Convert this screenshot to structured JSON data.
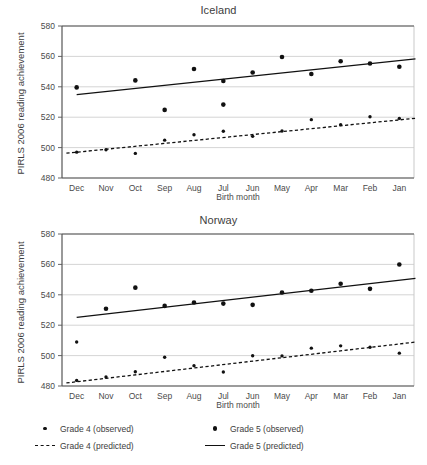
{
  "figure": {
    "background": "#ffffff",
    "ink": "#111111",
    "grid_color": "#c9c9c9",
    "axis_color": "#555555"
  },
  "legend": {
    "position": "bottom",
    "items": [
      {
        "label": "Grade 4 (observed)",
        "marker": "small-dot",
        "key": "grade4-observed"
      },
      {
        "label": "Grade 5 (observed)",
        "marker": "large-dot",
        "key": "grade5-observed"
      },
      {
        "label": "Grade 4 (predicted)",
        "marker": "dashed-line",
        "key": "grade4-predicted"
      },
      {
        "label": "Grade 5 (predicted)",
        "marker": "solid-line",
        "key": "grade5-predicted"
      }
    ]
  },
  "chart_data": [
    {
      "type": "scatter",
      "title": "Iceland",
      "xlabel": "Birth month",
      "ylabel": "PIRLS 2006 reading achievement",
      "categories": [
        "Dec",
        "Nov",
        "Oct",
        "Sep",
        "Aug",
        "Jul",
        "Jun",
        "May",
        "Apr",
        "Mar",
        "Feb",
        "Jan"
      ],
      "ylim": [
        480,
        580
      ],
      "yticks": [
        480,
        500,
        520,
        540,
        560,
        580
      ],
      "grid": true,
      "series": [
        {
          "name": "Grade 5 (observed)",
          "style": "large-dot",
          "values": [
            539.6,
            null,
            544.2,
            524.8,
            551.7,
            528.3,
            543.8,
            549.4,
            559.6,
            548.4,
            556.8,
            555.3,
            553.2
          ]
        },
        {
          "name": "Grade 4 (observed)",
          "style": "small-dot",
          "values": [
            497.0,
            498.6,
            496.2,
            504.9,
            508.5,
            510.8,
            507.4,
            510.9,
            518.4,
            515.1,
            520.3,
            519.2
          ]
        },
        {
          "name": "Grade 5 (predicted)",
          "style": "solid-line",
          "endpoints": [
            534.8,
            558.4
          ]
        },
        {
          "name": "Grade 4 (predicted)",
          "style": "dashed-line",
          "endpoints": [
            496.3,
            519.3
          ]
        }
      ],
      "observed_grade5": [
        {
          "x": "Dec",
          "y": 539.6
        },
        {
          "x": "Oct",
          "y": 544.2
        },
        {
          "x": "Sep",
          "y": 524.8
        },
        {
          "x": "Aug",
          "y": 551.7
        },
        {
          "x": "Jul",
          "y": 528.3
        },
        {
          "x": "Jul",
          "y": 543.8
        },
        {
          "x": "Jun",
          "y": 549.4
        },
        {
          "x": "May",
          "y": 559.6
        },
        {
          "x": "Apr",
          "y": 548.4
        },
        {
          "x": "Mar",
          "y": 556.8
        },
        {
          "x": "Feb",
          "y": 555.3
        },
        {
          "x": "Jan",
          "y": 553.2
        }
      ],
      "observed_grade4": [
        {
          "x": "Dec",
          "y": 497.0
        },
        {
          "x": "Nov",
          "y": 498.6
        },
        {
          "x": "Oct",
          "y": 496.2
        },
        {
          "x": "Sep",
          "y": 504.9
        },
        {
          "x": "Aug",
          "y": 508.5
        },
        {
          "x": "Jul",
          "y": 510.8
        },
        {
          "x": "Jun",
          "y": 507.4
        },
        {
          "x": "May",
          "y": 510.9
        },
        {
          "x": "Apr",
          "y": 518.4
        },
        {
          "x": "Mar",
          "y": 515.1
        },
        {
          "x": "Feb",
          "y": 520.3
        },
        {
          "x": "Jan",
          "y": 519.2
        }
      ]
    },
    {
      "type": "scatter",
      "title": "Norway",
      "xlabel": "Birth month",
      "ylabel": "PIRLS 2006 reading achievement",
      "categories": [
        "Dec",
        "Nov",
        "Oct",
        "Sep",
        "Aug",
        "Jul",
        "Jun",
        "May",
        "Apr",
        "Mar",
        "Feb",
        "Jan"
      ],
      "ylim": [
        480,
        580
      ],
      "yticks": [
        480,
        500,
        520,
        540,
        560,
        580
      ],
      "grid": true,
      "series": [
        {
          "name": "Grade 5 (observed)",
          "style": "large-dot",
          "values": [
            null,
            530.8,
            544.7,
            532.7,
            534.9,
            534.2,
            533.4,
            541.5,
            542.7,
            547.3,
            543.9,
            559.9
          ]
        },
        {
          "name": "Grade 4 (observed)",
          "style": "small-dot",
          "values": [
            508.9,
            485.9,
            489.4,
            498.9,
            493.4,
            489.2,
            499.9,
            499.8,
            504.9,
            506.4,
            505.5,
            501.6
          ]
        },
        {
          "name": "Grade 5 (predicted)",
          "style": "solid-line",
          "endpoints": [
            525.2,
            550.8
          ]
        },
        {
          "name": "Grade 4 (predicted)",
          "style": "dashed-line",
          "endpoints": [
            482.0,
            508.9
          ]
        }
      ],
      "observed_grade5": [
        {
          "x": "Nov",
          "y": 530.8
        },
        {
          "x": "Oct",
          "y": 544.7
        },
        {
          "x": "Sep",
          "y": 532.7
        },
        {
          "x": "Aug",
          "y": 534.9
        },
        {
          "x": "Jul",
          "y": 534.2
        },
        {
          "x": "Jun",
          "y": 533.4
        },
        {
          "x": "May",
          "y": 541.5
        },
        {
          "x": "Apr",
          "y": 542.7
        },
        {
          "x": "Mar",
          "y": 547.3
        },
        {
          "x": "Feb",
          "y": 543.9
        },
        {
          "x": "Jan",
          "y": 559.9
        }
      ],
      "observed_grade4": [
        {
          "x": "Dec",
          "y": 508.9
        },
        {
          "x": "Dec",
          "y": 483.7
        },
        {
          "x": "Nov",
          "y": 485.9
        },
        {
          "x": "Oct",
          "y": 489.4
        },
        {
          "x": "Sep",
          "y": 498.9
        },
        {
          "x": "Aug",
          "y": 493.4
        },
        {
          "x": "Jul",
          "y": 489.2
        },
        {
          "x": "Jun",
          "y": 499.9
        },
        {
          "x": "May",
          "y": 499.8
        },
        {
          "x": "Apr",
          "y": 504.9
        },
        {
          "x": "Mar",
          "y": 506.4
        },
        {
          "x": "Feb",
          "y": 505.5
        },
        {
          "x": "Jan",
          "y": 501.6
        }
      ]
    }
  ]
}
